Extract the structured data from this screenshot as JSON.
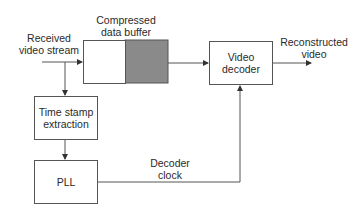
{
  "diagram": {
    "input_label_line1": "Received",
    "input_label_line2": "video stream",
    "buffer_label_line1": "Compressed",
    "buffer_label_line2": "data buffer",
    "decoder_label_line1": "Video",
    "decoder_label_line2": "decoder",
    "output_label_line1": "Reconstructed",
    "output_label_line2": "video",
    "timestamp_label_line1": "Time stamp",
    "timestamp_label_line2": "extraction",
    "pll_label": "PLL",
    "clock_label_line1": "Decoder",
    "clock_label_line2": "clock",
    "colors": {
      "line": "#555555",
      "buffer_fill": "#8a8a8a",
      "box_fill": "#ffffff"
    }
  }
}
